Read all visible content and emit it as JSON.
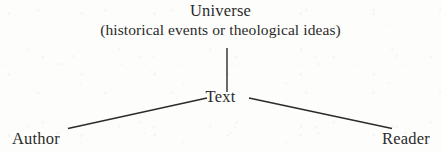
{
  "figure": {
    "type": "hermeneutic-communication-model",
    "background_color": "#fdfdfb",
    "line_color": "#2b2b2b",
    "text_color": "#2b2b2b"
  },
  "nodes": {
    "universe": {
      "label": "Universe",
      "sub_label": "(historical events or theological ideas)"
    },
    "text": {
      "label": "Text"
    },
    "author": {
      "label": "Author"
    },
    "reader": {
      "label": "Reader"
    }
  },
  "edges": [
    {
      "name": "universe-to-text",
      "from": "universe",
      "to": "text",
      "x1": 227,
      "y1": 48,
      "x2": 227,
      "y2": 92
    },
    {
      "name": "author-to-text",
      "from": "author",
      "to": "text",
      "x1": 68,
      "y1": 128,
      "x2": 207,
      "y2": 98
    },
    {
      "name": "text-to-reader",
      "from": "text",
      "to": "reader",
      "x1": 249,
      "y1": 98,
      "x2": 392,
      "y2": 128
    }
  ]
}
